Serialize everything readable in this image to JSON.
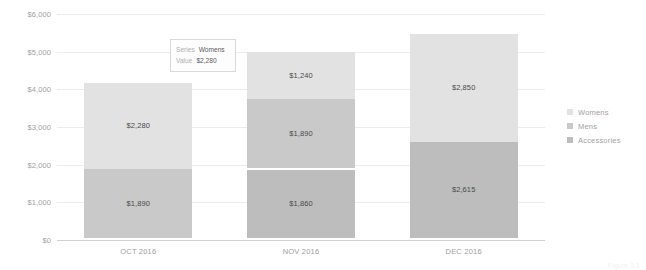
{
  "chart_data": {
    "type": "bar",
    "subtype": "stacked-bar",
    "title": "",
    "xlabel": "",
    "ylabel": "",
    "categories": [
      "OCT 2016",
      "NOV 2016",
      "DEC 2016"
    ],
    "ylim": [
      0,
      6000
    ],
    "y_ticks": [
      0,
      1000,
      2000,
      3000,
      4000,
      5000,
      6000
    ],
    "y_tick_labels": [
      "$0",
      "$1,000",
      "$2,000",
      "$3,000",
      "$4,000",
      "$5,000",
      "$6,000"
    ],
    "grid": true,
    "legend_position": "right",
    "series": [
      {
        "name": "Accessories",
        "color": "#bdbdbd",
        "values": [
          null,
          1860,
          2615
        ],
        "labels": [
          "",
          "$1,860",
          "$2,615"
        ]
      },
      {
        "name": "Mens",
        "color": "#c9c9c9",
        "values": [
          1890,
          1890,
          null
        ],
        "labels": [
          "$1,890",
          "$1,890",
          ""
        ]
      },
      {
        "name": "Womens",
        "color": "#e2e2e2",
        "values": [
          2280,
          1240,
          2850
        ],
        "labels": [
          "$2,280",
          "$1,240",
          "$2,850"
        ]
      }
    ],
    "totals": [
      4170,
      4990,
      5465
    ]
  },
  "legend": {
    "items": [
      {
        "label": "Womens",
        "color": "#e2e2e2"
      },
      {
        "label": "Mens",
        "color": "#c9c9c9"
      },
      {
        "label": "Accessories",
        "color": "#bdbdbd"
      }
    ]
  },
  "tooltip": {
    "visible": true,
    "series_key": "Series",
    "series_value": "Womens",
    "value_key": "Value",
    "value_value": "$2,280"
  },
  "caption": {
    "text": "Figure 3-1"
  }
}
